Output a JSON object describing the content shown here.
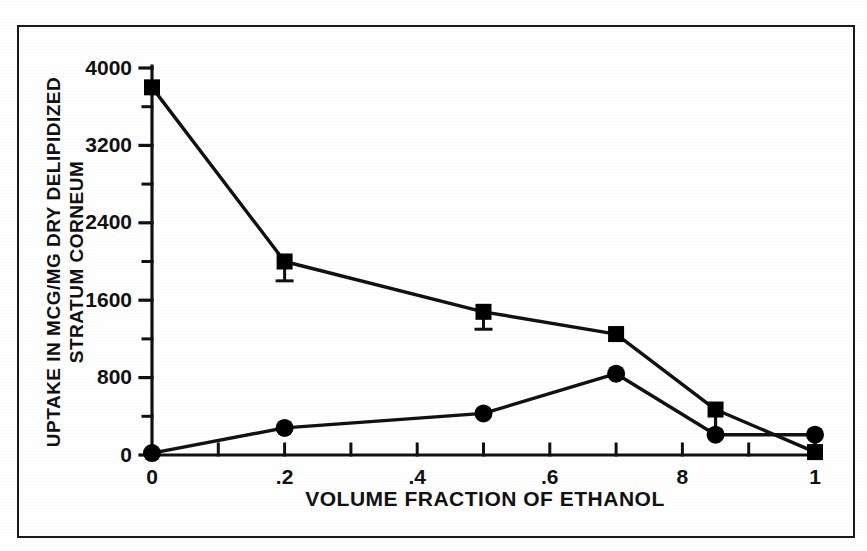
{
  "chart_data": {
    "type": "line",
    "title": "",
    "subtitle": "",
    "xlabel": "VOLUME FRACTION OF ETHANOL",
    "ylabel": "UPTAKE IN MCG/MG DRY DELIPIDIZED STRATUM CORNEUM",
    "ylabel_line1": "UPTAKE IN MCG/MG DRY DELIPIDIZED",
    "ylabel_line2": "STRATUM CORNEUM",
    "xlim": [
      0,
      1
    ],
    "ylim": [
      0,
      4000
    ],
    "grid": false,
    "legend": "none",
    "x_tick_labels": [
      "0",
      ".2",
      ".4",
      ".6",
      "8",
      "1"
    ],
    "x_tick_values": [
      0,
      0.2,
      0.4,
      0.6,
      0.8,
      1
    ],
    "x_minor_ticks": [
      0.1,
      0.2,
      0.3,
      0.4,
      0.5,
      0.6,
      0.7,
      0.8,
      0.9,
      1
    ],
    "y_tick_labels": [
      "0",
      "800",
      "1600",
      "2400",
      "3200",
      "4000"
    ],
    "y_tick_values": [
      0,
      800,
      1600,
      2400,
      3200,
      4000
    ],
    "y_minor_ticks": [
      400,
      1200,
      2000,
      2800,
      3600
    ],
    "series": [
      {
        "name": "square-series",
        "marker": "square",
        "x": [
          0,
          0.2,
          0.5,
          0.7,
          0.85,
          1
        ],
        "values": [
          3800,
          2000,
          1480,
          1250,
          470,
          30
        ],
        "errors_low": [
          0,
          200,
          180,
          0,
          0,
          0
        ],
        "errors_high": [
          0,
          0,
          60,
          0,
          0,
          0
        ]
      },
      {
        "name": "circle-series",
        "marker": "circle",
        "x": [
          0,
          0.2,
          0.5,
          0.7,
          0.85,
          1
        ],
        "values": [
          20,
          280,
          430,
          840,
          210,
          210
        ],
        "errors_low": [
          0,
          0,
          0,
          0,
          0,
          0
        ],
        "errors_high": [
          0,
          0,
          0,
          0,
          0,
          0
        ]
      }
    ],
    "colors": {
      "line": "#111111",
      "marker": "#000000",
      "axis": "#111111",
      "background": "#ffffff",
      "frame": "#1a1a1a"
    }
  }
}
